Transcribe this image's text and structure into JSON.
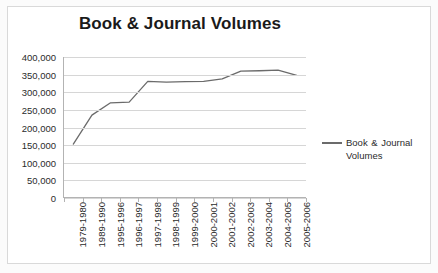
{
  "chart_data": {
    "type": "line",
    "title": "Book & Journal Volumes",
    "xlabel": "",
    "ylabel": "",
    "ylim": [
      0,
      400000
    ],
    "ytick_step": 50000,
    "grid": true,
    "legend_position": "right",
    "line_color": "#6b6b6b",
    "gridline_color": "#d6d6d6",
    "categories": [
      "1979-1980",
      "1989-1990",
      "1995-1996",
      "1996-1997",
      "1997-1998",
      "1998-1999",
      "1999-2000",
      "2000-2001",
      "2001-2002",
      "2002-2003",
      "2003-2004",
      "2004-2005",
      "2005-2006"
    ],
    "series": [
      {
        "name": "Book & Journal Volumes",
        "values": [
          153000,
          235000,
          270000,
          272000,
          331000,
          329000,
          330000,
          331000,
          338000,
          360000,
          361000,
          363000,
          348000
        ]
      }
    ],
    "ytick_labels": [
      "400,000",
      "350,000",
      "300,000",
      "250,000",
      "200,000",
      "150,000",
      "100,000",
      "50,000",
      "0"
    ],
    "ytick_values": [
      400000,
      350000,
      300000,
      250000,
      200000,
      150000,
      100000,
      50000,
      0
    ]
  },
  "legend": {
    "entries": [
      {
        "label": "Book & Journal Volumes"
      }
    ]
  }
}
